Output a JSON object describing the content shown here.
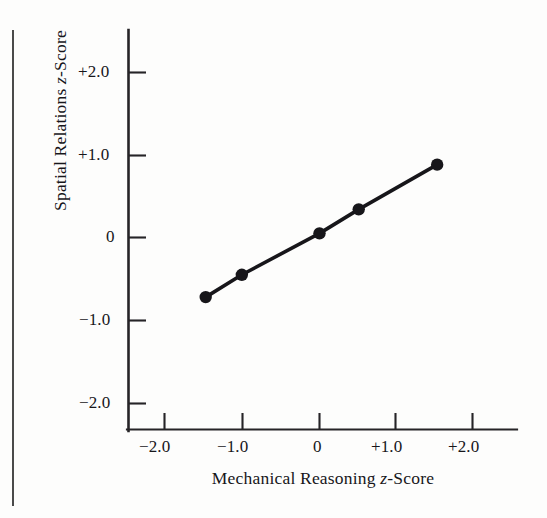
{
  "chart_data": {
    "type": "line",
    "title": "",
    "subtitle": "",
    "xlabel": "Mechanical Reasoning z-Score",
    "ylabel": "Spatial Relations z-Score",
    "xlim": [
      -2.55,
      2.58
    ],
    "ylim": [
      -2.58,
      2.52
    ],
    "xticks": [
      -2.0,
      -1.0,
      0,
      1.0,
      2.0
    ],
    "yticks": [
      2.0,
      1.0,
      0,
      -1.0,
      -2.0
    ],
    "xticklabels": [
      "−2.0",
      "−1.0",
      "0",
      "+1.0",
      "+2.0"
    ],
    "yticklabels": [
      "+2.0",
      "+1.0",
      "0",
      "−1.0",
      "−2.0"
    ],
    "grid": false,
    "legend": null,
    "series": [
      {
        "name": "Regression of Spatial Relations on Mechanical Reasoning",
        "marker": "filled-circle",
        "line": "solid",
        "color": "#17161a",
        "x": [
          -1.48,
          -1.01,
          0.0,
          0.51,
          1.53
        ],
        "y": [
          -0.72,
          -0.45,
          0.05,
          0.34,
          0.88
        ],
        "points": [
          {
            "x": -1.48,
            "y": -0.72
          },
          {
            "x": -1.01,
            "y": -0.45
          },
          {
            "x": 0.0,
            "y": 0.05
          },
          {
            "x": 0.51,
            "y": 0.34
          },
          {
            "x": 1.53,
            "y": 0.88
          }
        ]
      }
    ],
    "annotations": []
  },
  "axes": {
    "x_axis_title": "Mechanical Reasoning ",
    "x_axis_title_italic": "z",
    "x_axis_title_tail": "-Score",
    "y_axis_title": "Spatial Relations ",
    "y_axis_title_italic": "z",
    "y_axis_title_tail": "-Score"
  },
  "colors": {
    "ink": "#17161a",
    "axis": "#262427",
    "rule": "#4a4a4a",
    "paper": "#fdfdfc"
  }
}
